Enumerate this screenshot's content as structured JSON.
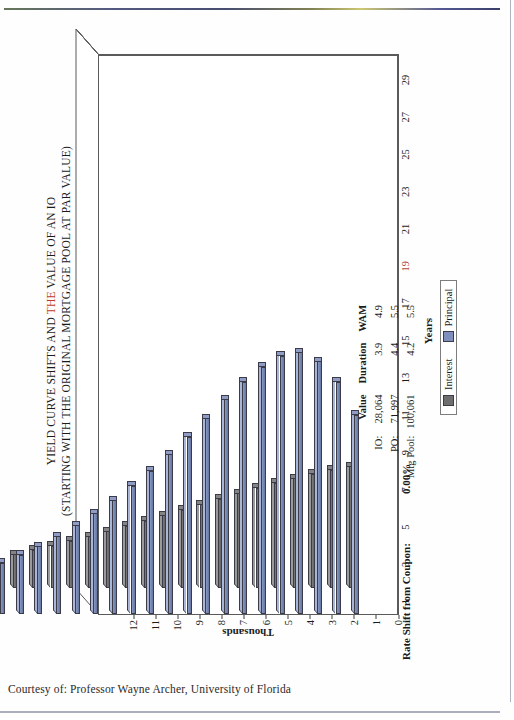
{
  "page": {
    "credit": "Courtesy of: Professor Wayne Archer, University of Florida"
  },
  "annotations": {
    "rate_shift_label": "Rate Shift from Coupon:",
    "rate_shift_value": "0.00%"
  },
  "summary": {
    "headers": [
      "",
      "Value",
      "Duration",
      "WAM"
    ],
    "rows": [
      {
        "label": "IO:",
        "value": "28,064",
        "duration": "3.9",
        "wam": "4.9"
      },
      {
        "label": "PO:",
        "value": "71,997",
        "duration": "4.4",
        "wam": "5.5"
      },
      {
        "label": "Mtg Pool:",
        "value": "100,061",
        "duration": "4.2",
        "wam": "5.5"
      }
    ]
  },
  "chart_data": {
    "type": "bar",
    "title": "YIELD CURVE SHIFTS AND THE VALUE OF AN IO",
    "title_line1_parts": [
      "YIELD CURVE SHIFTS AND ",
      "THE",
      " VALUE OF AN IO"
    ],
    "title_line2": "(STARTING WITH THE ORIGINAL MORTGAGE POOL AT PAR VALUE)",
    "title_line3": "\"IO\" AND \"PO\" CASH FLOWS",
    "title_highlight_word": "THE",
    "title_highlight_color": "#c0392b",
    "xlabel": "Years",
    "ylabel": "Thousands",
    "grid": false,
    "legend_position": "bottom-center",
    "ylim": [
      0,
      12
    ],
    "ytick_labels": [
      "0",
      "1",
      "2",
      "3",
      "4",
      "5",
      "6",
      "7",
      "8",
      "9",
      "10",
      "11",
      "12"
    ],
    "xtick_labels": [
      "1",
      "3",
      "5",
      "7",
      "9",
      "11",
      "13",
      "15",
      "17",
      "19",
      "21",
      "23",
      "25",
      "27",
      "29"
    ],
    "xtick_highlight": "19",
    "x": [
      1,
      2,
      3,
      4,
      5,
      6,
      7,
      8,
      9,
      10,
      11,
      12,
      13,
      14,
      15,
      16,
      17,
      18,
      19,
      20,
      21,
      22,
      23,
      24,
      25,
      26,
      27,
      28,
      29,
      30
    ],
    "series": [
      {
        "name": "Interest",
        "color": "#6e6e6e",
        "values": [
          5.55,
          5.4,
          5.22,
          5.02,
          4.8,
          4.57,
          4.33,
          4.08,
          3.83,
          3.58,
          3.33,
          3.08,
          2.84,
          2.6,
          2.37,
          2.15,
          1.94,
          1.74,
          1.55,
          1.37,
          1.2,
          1.04,
          0.89,
          0.75,
          0.62,
          0.5,
          0.39,
          0.29,
          0.2,
          0.11
        ]
      },
      {
        "name": "Principal",
        "color": "#7f8fbd",
        "values": [
          9.1,
          10.6,
          11.55,
          11.95,
          11.8,
          11.3,
          10.6,
          9.8,
          8.95,
          8.1,
          7.3,
          6.55,
          5.85,
          5.2,
          4.6,
          4.05,
          3.55,
          3.1,
          2.7,
          2.35,
          2.02,
          1.73,
          1.47,
          1.24,
          1.03,
          0.85,
          0.68,
          0.53,
          0.39,
          0.26
        ]
      }
    ]
  }
}
